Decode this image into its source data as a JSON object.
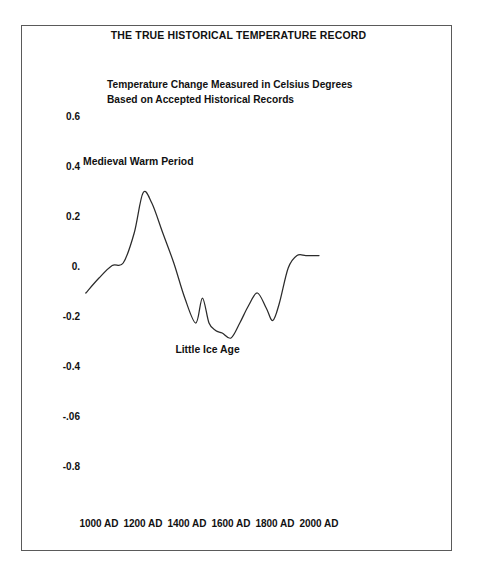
{
  "chart_data": {
    "type": "line",
    "title": "THE TRUE HISTORICAL TEMPERATURE RECORD",
    "subtitle_line1": "Temperature Change Measured in Celsius Degrees",
    "subtitle_line2": "Based on Accepted Historical Records",
    "xlabel": "",
    "ylabel": "",
    "xlim": [
      900,
      2050
    ],
    "ylim": [
      -0.9,
      0.7
    ],
    "grid": false,
    "legend": "none",
    "line_color": "#2b2b2b",
    "background_color": "#ffffff",
    "border_color": "#5a5a5a",
    "y_ticks": [
      {
        "label": "0.6",
        "value": 0.6
      },
      {
        "label": "0.4",
        "value": 0.4
      },
      {
        "label": "0.2",
        "value": 0.2
      },
      {
        "label": "0.",
        "value": 0.0
      },
      {
        "label": "-0.2",
        "value": -0.2
      },
      {
        "label": "-0.4",
        "value": -0.4
      },
      {
        "label": "-.06",
        "value": -0.6
      },
      {
        "label": "-0.8",
        "value": -0.8
      }
    ],
    "x_ticks": [
      {
        "label": "1000 AD",
        "value": 1000
      },
      {
        "label": "1200 AD",
        "value": 1200
      },
      {
        "label": "1400 AD",
        "value": 1400
      },
      {
        "label": "1600 AD",
        "value": 1600
      },
      {
        "label": "1800 AD",
        "value": 1800
      },
      {
        "label": "2000 AD",
        "value": 2000
      }
    ],
    "annotations": [
      {
        "text": "Medieval Warm Period",
        "x": 1200,
        "y": 0.42
      },
      {
        "text": "Little Ice Age",
        "x": 1620,
        "y": -0.33
      }
    ],
    "series": [
      {
        "name": "Temperature anomaly",
        "x": [
          940,
          1000,
          1060,
          1110,
          1160,
          1200,
          1240,
          1290,
          1340,
          1390,
          1440,
          1470,
          1500,
          1530,
          1560,
          1600,
          1640,
          1680,
          1720,
          1760,
          1790,
          1820,
          1860,
          1900,
          1940,
          1980,
          2000
        ],
        "values": [
          -0.1,
          -0.04,
          0.01,
          0.02,
          0.14,
          0.3,
          0.26,
          0.14,
          0.02,
          -0.12,
          -0.22,
          -0.12,
          -0.22,
          -0.25,
          -0.26,
          -0.28,
          -0.22,
          -0.15,
          -0.1,
          -0.16,
          -0.21,
          -0.14,
          0.0,
          0.05,
          0.05,
          0.05,
          0.05
        ]
      }
    ]
  }
}
